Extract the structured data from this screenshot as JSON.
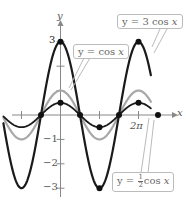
{
  "chart_data": {
    "type": "line",
    "title": "",
    "xlabel": "x",
    "ylabel": "y",
    "x_range": [
      -4.6,
      7.3
    ],
    "ylim": [
      -3.3,
      3.5
    ],
    "x_ticks": [
      {
        "value": -3.14159,
        "label": ""
      },
      {
        "value": 3.14159,
        "label": ""
      },
      {
        "value": 6.28319,
        "label": "2π"
      }
    ],
    "y_ticks": [
      {
        "value": 3,
        "label": "3"
      },
      {
        "value": 2,
        "label": ""
      },
      {
        "value": 1,
        "label": ""
      },
      {
        "value": -1,
        "label": "−1"
      },
      {
        "value": -2,
        "label": "−2"
      },
      {
        "value": -3,
        "label": "−3"
      }
    ],
    "grid": false,
    "series": [
      {
        "name": "y = 3 cos x",
        "amplitude": 3,
        "color": "#1a1a1a",
        "width": 2.2,
        "marked_points": [
          [
            0,
            3
          ],
          [
            3.14159,
            -3
          ],
          [
            6.28319,
            3
          ]
        ]
      },
      {
        "name": "y = cos x",
        "amplitude": 1,
        "color": "#a8a8a8",
        "width": 2.2,
        "marked_points": []
      },
      {
        "name": "y = 1/2 cos x",
        "amplitude": 0.5,
        "color": "#1a1a1a",
        "width": 1.8,
        "marked_points": [
          [
            -1.5708,
            0
          ],
          [
            0,
            0.5
          ],
          [
            1.5708,
            0
          ],
          [
            3.14159,
            -0.5
          ],
          [
            4.71239,
            0
          ],
          [
            6.28319,
            0.5
          ],
          [
            7.85398,
            0
          ]
        ]
      }
    ]
  },
  "labels": {
    "y_axis": "y",
    "x_axis": "x",
    "y_tick_3": "3",
    "y_tick_m1": "−1",
    "y_tick_m2": "−2",
    "y_tick_m3": "−3",
    "x_tick_2pi": "2π",
    "callout_3cos": {
      "prefix": "y = 3 cos ",
      "var": "x"
    },
    "callout_cos": {
      "prefix": "y = cos ",
      "var": "x"
    },
    "callout_half": {
      "prefix": "y = ",
      "num": "1",
      "den": "2",
      "mid": "cos ",
      "var": "x"
    }
  }
}
